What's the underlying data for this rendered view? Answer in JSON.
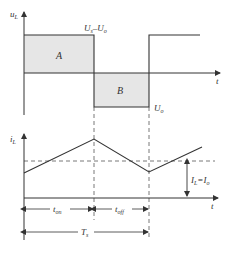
{
  "diagram": {
    "type": "buck-converter-inductor-waveforms",
    "top_plot": {
      "y_axis_label": "u",
      "y_axis_sub": "L",
      "x_axis_label": "t",
      "upper_level_label": "U",
      "upper_level_sub": "s",
      "upper_level_rest": "–U",
      "upper_level_sub2": "o",
      "lower_level_label": "U",
      "lower_level_sub": "o",
      "area_a_label": "A",
      "area_b_label": "B"
    },
    "bottom_plot": {
      "y_axis_label": "i",
      "y_axis_sub": "L",
      "x_axis_label": "t",
      "avg_label": "I",
      "avg_sub": "L",
      "avg_eq": "=I",
      "avg_sub2": "o",
      "t_on_label": "t",
      "t_on_sub": "on",
      "t_off_label": "t",
      "t_off_sub": "off",
      "ts_label": "T",
      "ts_sub": "s"
    },
    "colors": {
      "line": "#333333",
      "fill": "#e6e6e6",
      "dashed": "#555555"
    }
  }
}
